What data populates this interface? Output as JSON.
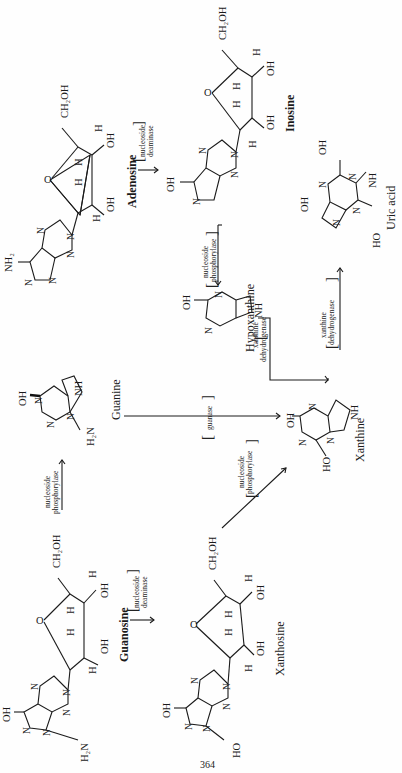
{
  "page_number": "364",
  "compounds": {
    "adenosine": {
      "name": "Adenosine",
      "substituents": {
        "amine": "NH₂",
        "ch2oh": "CH₂OH",
        "ring_o": "O",
        "h1": "H",
        "h2": "H",
        "h3": "H",
        "h4": "H",
        "oh1": "OH",
        "oh2": "OH"
      }
    },
    "inosine": {
      "name": "Inosine",
      "substituents": {
        "oh_base": "OH",
        "ch2oh": "CH₂OH",
        "ring_o": "O",
        "h1": "H",
        "h2": "H",
        "h3": "H",
        "h4": "H",
        "oh1": "OH",
        "oh2": "OH"
      }
    },
    "guanine": {
      "name": "Guanine",
      "substituents": {
        "oh": "OH",
        "amine": "H₂N",
        "nh": "NH"
      }
    },
    "hypoxanthine": {
      "name": "Hypoxanthine",
      "substituents": {
        "oh": "OH",
        "nh": "NH"
      }
    },
    "xanthine": {
      "name": "Xanthine",
      "substituents": {
        "oh": "OH",
        "ho": "HO",
        "nh": "NH"
      }
    },
    "uric_acid": {
      "name": "Uric acid",
      "substituents": {
        "oh1": "OH",
        "oh2": "OH",
        "ho": "HO",
        "nh": "NH"
      }
    },
    "guanosine": {
      "name": "Guanosine",
      "substituents": {
        "oh_base": "OH",
        "amine": "H₂N",
        "ch2oh": "CH₂OH",
        "ring_o": "O",
        "h1": "H",
        "h2": "H",
        "h3": "H",
        "h4": "H",
        "oh1": "OH",
        "oh2": "OH"
      }
    },
    "xanthosine": {
      "name": "Xanthosine",
      "substituents": {
        "oh_base": "OH",
        "ho_base": "HO",
        "ch2oh": "CH₂OH",
        "ring_o": "O",
        "h1": "H",
        "h2": "H",
        "h3": "H",
        "h4": "H",
        "oh1": "OH",
        "oh2": "OH"
      }
    }
  },
  "ring_atom": "N",
  "enzymes": {
    "adenosine_deaminase": [
      "nucleoside",
      "deaminase"
    ],
    "inosine_phosphorylase": [
      "nucleoside",
      "phosphorylase"
    ],
    "hypoxanthine_to_xanthine": [
      "xanthine",
      "dehydrogenase"
    ],
    "xanthine_to_uric_acid": [
      "xanthine",
      "dehydrogenase"
    ],
    "guanase": [
      "guanase"
    ],
    "guanosine_phosphorylase": [
      "nucleoside",
      "phosphorylase"
    ],
    "guanosine_deaminase": [
      "nucleoside",
      "deaminase"
    ],
    "xanthosine_phosphorylase": [
      "nucleoside",
      "phosphorylase"
    ]
  },
  "brackets": {
    "open": "[",
    "close": "]"
  }
}
